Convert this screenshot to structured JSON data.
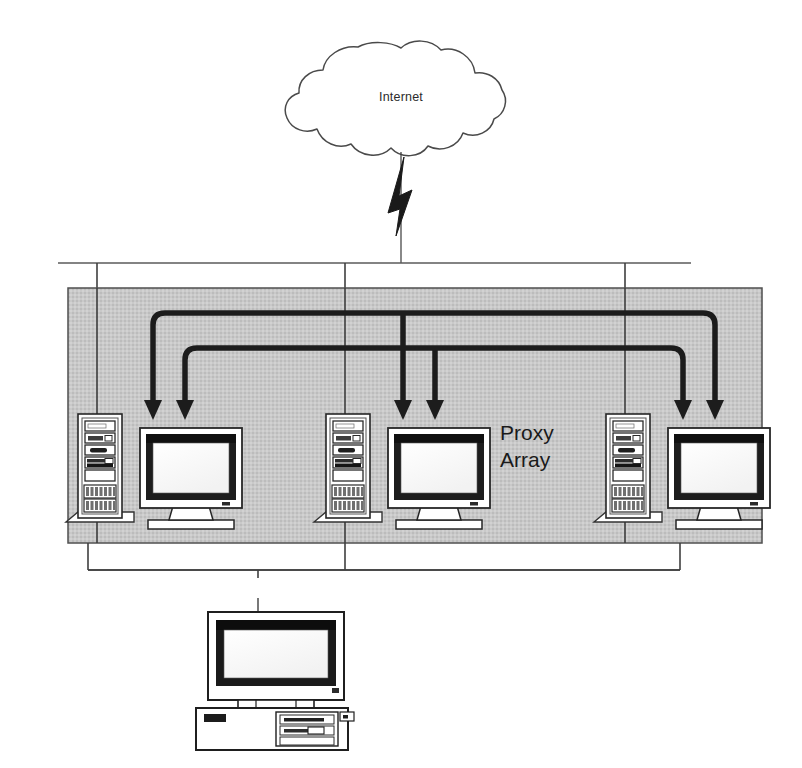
{
  "diagram": {
    "title": "Proxy Array",
    "background_color": "#ffffff",
    "line_color": "#3a3a3a",
    "arrow_color": "#1c1c1c",
    "zone_fill_color": "#c6c6c6",
    "zone_border_color": "#4a4a4a"
  },
  "cloud": {
    "label": "Internet",
    "icon": "cloud-icon",
    "fill": "#ffffff",
    "stroke": "#444444"
  },
  "link": {
    "icon": "lightning-bolt-icon",
    "label": ""
  },
  "zone": {
    "label_line_1": "Proxy",
    "label_line_2": "Array",
    "full_label": "Proxy Array"
  },
  "proxy_servers": [
    {
      "id": "proxy-1",
      "tower_icon": "server-tower-icon",
      "monitor_icon": "crt-monitor-icon",
      "inbound_arrows": 2
    },
    {
      "id": "proxy-2",
      "tower_icon": "server-tower-icon",
      "monitor_icon": "crt-monitor-icon",
      "inbound_arrows": 2
    },
    {
      "id": "proxy-3",
      "tower_icon": "server-tower-icon",
      "monitor_icon": "crt-monitor-icon",
      "inbound_arrows": 2
    }
  ],
  "client": {
    "id": "client-workstation",
    "icon": "desktop-computer-icon",
    "label": ""
  },
  "buses": {
    "upstream_label": "",
    "downstream_label": ""
  }
}
